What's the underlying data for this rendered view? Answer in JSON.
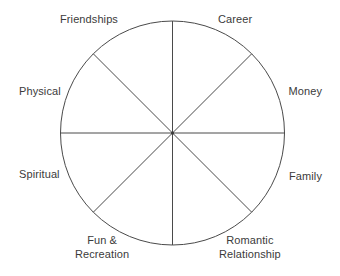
{
  "diagram": {
    "type": "wheel-of-life",
    "background_color": "#ffffff",
    "stroke_color": "#4a4a4a",
    "text_color": "#3b3b3b",
    "circle": {
      "center_x": 172.5,
      "center_y": 133,
      "radius": 112,
      "stroke_width": 1
    },
    "spokes": 8,
    "segments": [
      {
        "id": "career",
        "label": "Career",
        "lines": [
          "Career"
        ],
        "angle_deg": 22.5
      },
      {
        "id": "money",
        "label": "Money",
        "lines": [
          "Money"
        ],
        "angle_deg": 67.5
      },
      {
        "id": "family",
        "label": "Family",
        "lines": [
          "Family"
        ],
        "angle_deg": 112.5
      },
      {
        "id": "romantic",
        "label": "Romantic Relationship",
        "lines": [
          "Romantic",
          "Relationship"
        ],
        "angle_deg": 157.5
      },
      {
        "id": "fun",
        "label": "Fun & Recreation",
        "lines": [
          "Fun &",
          "Recreation"
        ],
        "angle_deg": 202.5
      },
      {
        "id": "spiritual",
        "label": "Spiritual",
        "lines": [
          "Spiritual"
        ],
        "angle_deg": 247.5
      },
      {
        "id": "physical",
        "label": "Physical",
        "lines": [
          "Physical"
        ],
        "angle_deg": 292.5
      },
      {
        "id": "friendships",
        "label": "Friendships",
        "lines": [
          "Friendships"
        ],
        "angle_deg": 337.5
      }
    ]
  },
  "labels": {
    "friendships": "Friendships",
    "career": "Career",
    "physical": "Physical",
    "money": "Money",
    "spiritual": "Spiritual",
    "family": "Family",
    "fun_line1": "Fun &",
    "fun_line2": "Recreation",
    "romantic_line1": "Romantic",
    "romantic_line2": "Relationship"
  }
}
